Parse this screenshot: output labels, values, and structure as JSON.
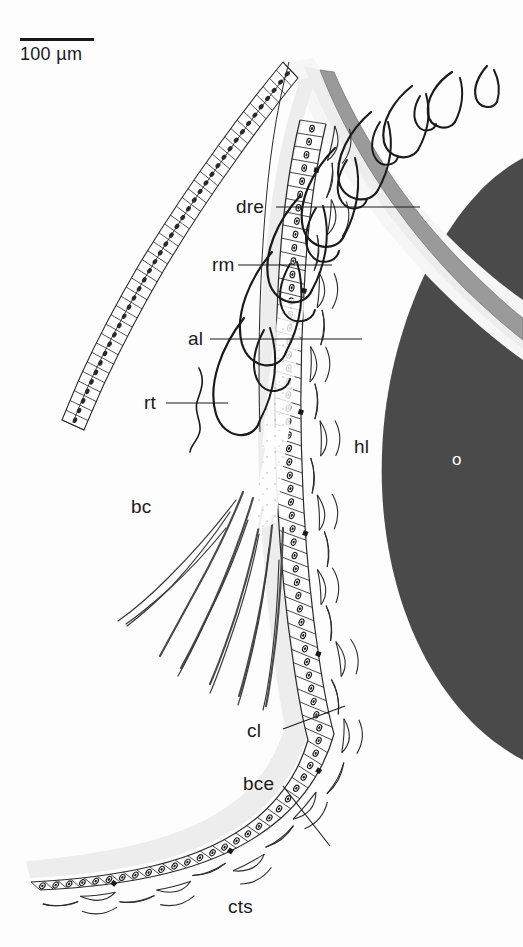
{
  "figure": {
    "type": "histological-section-diagram",
    "background_color": "#fdfdfd",
    "ink_color": "#1a1a1a"
  },
  "scale_bar": {
    "label": "100 µm",
    "bar_length_px": 74
  },
  "labels": [
    {
      "key": "dre",
      "text": "dre",
      "x": 236,
      "y": 198,
      "color": "#1a1a1a",
      "leader": true
    },
    {
      "key": "rm",
      "text": "rm",
      "x": 212,
      "y": 256,
      "color": "#1a1a1a",
      "leader": true
    },
    {
      "key": "al",
      "text": "al",
      "x": 188,
      "y": 330,
      "color": "#1a1a1a",
      "leader": true
    },
    {
      "key": "rt",
      "text": "rt",
      "x": 144,
      "y": 394,
      "color": "#1a1a1a",
      "leader": true
    },
    {
      "key": "bc",
      "text": "bc",
      "x": 131,
      "y": 498,
      "color": "#1a1a1a",
      "leader": false
    },
    {
      "key": "hl",
      "text": "hl",
      "x": 354,
      "y": 438,
      "color": "#1a1a1a",
      "leader": false
    },
    {
      "key": "o",
      "text": "o",
      "x": 452,
      "y": 452,
      "color": "#ffffff",
      "leader": false
    },
    {
      "key": "cl",
      "text": "cl",
      "x": 247,
      "y": 722,
      "color": "#1a1a1a",
      "leader": true
    },
    {
      "key": "bce",
      "text": "bce",
      "x": 243,
      "y": 775,
      "color": "#1a1a1a",
      "leader": true
    },
    {
      "key": "cts",
      "text": "cts",
      "x": 228,
      "y": 898,
      "color": "#1a1a1a",
      "leader": false
    }
  ],
  "colors": {
    "ovum_fill": "#4a4a4a",
    "dark_band": "#9a9a9a",
    "mid_band": "#b8b8b8",
    "light_band": "#ededed",
    "pale_band": "#f6f6f6",
    "outline": "#1a1a1a",
    "thin_outline": "#3a3a3a"
  },
  "structures": [
    {
      "name": "ovum",
      "label_key": "o",
      "fill": "#4a4a4a"
    },
    {
      "name": "homogeneous-layer",
      "label_key": "hl",
      "fill": "#ffffff"
    },
    {
      "name": "dense-rod-epithelium",
      "label_key": "dre",
      "fill": "#9a9a9a"
    },
    {
      "name": "radial-muscle-hooks",
      "label_key": "rm",
      "fill": "none"
    },
    {
      "name": "apical-lamella-hooks",
      "label_key": "al",
      "fill": "none"
    },
    {
      "name": "rootlet-thread",
      "label_key": "rt",
      "fill": "none"
    },
    {
      "name": "bursal-cavity",
      "label_key": "bc",
      "fill": "#ffffff"
    },
    {
      "name": "cuticular-layer",
      "label_key": "cl",
      "fill": "#ededed"
    },
    {
      "name": "bursal-copulatrix-epithelium",
      "label_key": "bce",
      "fill": "#ffffff"
    },
    {
      "name": "connective-tissue-strands",
      "label_key": "cts",
      "fill": "none"
    }
  ]
}
